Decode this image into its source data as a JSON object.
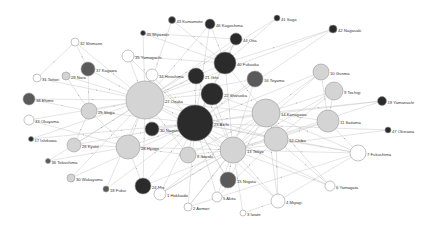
{
  "diagram": {
    "type": "network-graph",
    "colors": {
      "dark": "#2b2b2b",
      "mid": "#5a5a5a",
      "light": "#d4d4d4",
      "white": "#ffffff",
      "edge": "#c8c8c8"
    },
    "nodes": [
      {
        "id": "32",
        "label": "32 Shimane",
        "x": 75,
        "y": 42,
        "r": 4,
        "fill": "white"
      },
      {
        "id": "43",
        "label": "43 Kumamoto",
        "x": 172,
        "y": 20,
        "r": 3.5,
        "fill": "dark"
      },
      {
        "id": "46",
        "label": "46 Kagoshima",
        "x": 210,
        "y": 24,
        "r": 5,
        "fill": "dark"
      },
      {
        "id": "41",
        "label": "41 Saga",
        "x": 277,
        "y": 18,
        "r": 3,
        "fill": "dark"
      },
      {
        "id": "45",
        "label": "45 Miyazaki",
        "x": 143,
        "y": 33,
        "r": 2.5,
        "fill": "dark"
      },
      {
        "id": "42",
        "label": "42 Nagasaki",
        "x": 333,
        "y": 29,
        "r": 4,
        "fill": "dark"
      },
      {
        "id": "44",
        "label": "44 Oita",
        "x": 236,
        "y": 39,
        "r": 6,
        "fill": "dark"
      },
      {
        "id": "35",
        "label": "35 Yamaguchi",
        "x": 128,
        "y": 56,
        "r": 6,
        "fill": "white"
      },
      {
        "id": "37",
        "label": "37 Kagawa",
        "x": 88,
        "y": 69,
        "r": 7,
        "fill": "mid"
      },
      {
        "id": "31",
        "label": "31 Tottori",
        "x": 37,
        "y": 78,
        "r": 4,
        "fill": "white"
      },
      {
        "id": "29",
        "label": "29 Nara",
        "x": 66,
        "y": 76,
        "r": 4,
        "fill": "light"
      },
      {
        "id": "40",
        "label": "40 Fukuoka",
        "x": 225,
        "y": 63,
        "r": 11,
        "fill": "dark"
      },
      {
        "id": "34",
        "label": "34 Hiroshima",
        "x": 152,
        "y": 75,
        "r": 6,
        "fill": "white"
      },
      {
        "id": "21",
        "label": "21 Gifu",
        "x": 196,
        "y": 76,
        "r": 8,
        "fill": "dark"
      },
      {
        "id": "16",
        "label": "16 Toyama",
        "x": 255,
        "y": 79,
        "r": 8,
        "fill": "mid"
      },
      {
        "id": "10",
        "label": "10 Gunma",
        "x": 321,
        "y": 72,
        "r": 8,
        "fill": "light"
      },
      {
        "id": "38",
        "label": "38 Ehime",
        "x": 29,
        "y": 99,
        "r": 6,
        "fill": "mid"
      },
      {
        "id": "27",
        "label": "27 Osaka",
        "x": 145,
        "y": 100,
        "r": 19,
        "fill": "light"
      },
      {
        "id": "22",
        "label": "22 Shizuoka",
        "x": 212,
        "y": 94,
        "r": 11,
        "fill": "dark"
      },
      {
        "id": "9",
        "label": "9 Tochigi",
        "x": 334,
        "y": 91,
        "r": 9,
        "fill": "light"
      },
      {
        "id": "19",
        "label": "19 Yamanashi",
        "x": 382,
        "y": 101,
        "r": 4.5,
        "fill": "dark"
      },
      {
        "id": "25",
        "label": "25 Shiga",
        "x": 89,
        "y": 111,
        "r": 8,
        "fill": "light"
      },
      {
        "id": "14",
        "label": "14 Kanagawa",
        "x": 266,
        "y": 113,
        "r": 14,
        "fill": "light"
      },
      {
        "id": "33",
        "label": "33 Okayama",
        "x": 29,
        "y": 120,
        "r": 5,
        "fill": "white"
      },
      {
        "id": "30",
        "label": "30 Nagano",
        "x": 152,
        "y": 129,
        "r": 7,
        "fill": "dark"
      },
      {
        "id": "23",
        "label": "23 Aichi",
        "x": 195,
        "y": 123,
        "r": 18,
        "fill": "dark"
      },
      {
        "id": "11",
        "label": "11 Saitama",
        "x": 328,
        "y": 121,
        "r": 11,
        "fill": "light"
      },
      {
        "id": "17",
        "label": "17 Ishikawa",
        "x": 31,
        "y": 139,
        "r": 2.5,
        "fill": "dark"
      },
      {
        "id": "47",
        "label": "47 Okinawa",
        "x": 388,
        "y": 130,
        "r": 3,
        "fill": "dark"
      },
      {
        "id": "28",
        "label": "28 Hyogo",
        "x": 128,
        "y": 147,
        "r": 12,
        "fill": "light"
      },
      {
        "id": "26",
        "label": "26 Kyoto",
        "x": 74,
        "y": 145,
        "r": 7,
        "fill": "light"
      },
      {
        "id": "12",
        "label": "12 Chiba",
        "x": 276,
        "y": 139,
        "r": 12,
        "fill": "light"
      },
      {
        "id": "13",
        "label": "13 Tokyo",
        "x": 233,
        "y": 150,
        "r": 13,
        "fill": "light"
      },
      {
        "id": "8",
        "label": "8 Ibaraki",
        "x": 188,
        "y": 155,
        "r": 8,
        "fill": "light"
      },
      {
        "id": "36",
        "label": "36 Tokushima",
        "x": 48,
        "y": 161,
        "r": 2.5,
        "fill": "mid"
      },
      {
        "id": "15",
        "label": "15 Niigata",
        "x": 228,
        "y": 180,
        "r": 8,
        "fill": "mid"
      },
      {
        "id": "7",
        "label": "7 Fukushima",
        "x": 358,
        "y": 153,
        "r": 8,
        "fill": "white"
      },
      {
        "id": "30w",
        "label": "30 Wakayama",
        "x": 71,
        "y": 178,
        "r": 4,
        "fill": "light"
      },
      {
        "id": "24",
        "label": "24 Mie",
        "x": 143,
        "y": 186,
        "r": 8,
        "fill": "dark"
      },
      {
        "id": "18",
        "label": "18 Fukui",
        "x": 106,
        "y": 189,
        "r": 3,
        "fill": "mid"
      },
      {
        "id": "1",
        "label": "1 Hokkaido",
        "x": 160,
        "y": 194,
        "r": 6,
        "fill": "white"
      },
      {
        "id": "5",
        "label": "5 Akita",
        "x": 217,
        "y": 197,
        "r": 5,
        "fill": "white"
      },
      {
        "id": "6",
        "label": "6 Yamagata",
        "x": 330,
        "y": 186,
        "r": 5,
        "fill": "white"
      },
      {
        "id": "4",
        "label": "4 Miyagi",
        "x": 278,
        "y": 201,
        "r": 7,
        "fill": "white"
      },
      {
        "id": "2",
        "label": "2 Aomori",
        "x": 188,
        "y": 207,
        "r": 4,
        "fill": "white"
      },
      {
        "id": "3",
        "label": "3 Iwate",
        "x": 243,
        "y": 213,
        "r": 3,
        "fill": "white"
      }
    ],
    "edges": [
      [
        "32",
        "27"
      ],
      [
        "32",
        "31"
      ],
      [
        "32",
        "37"
      ],
      [
        "43",
        "40"
      ],
      [
        "43",
        "27"
      ],
      [
        "46",
        "40"
      ],
      [
        "46",
        "27"
      ],
      [
        "46",
        "23"
      ],
      [
        "45",
        "27"
      ],
      [
        "45",
        "40"
      ],
      [
        "45",
        "44"
      ],
      [
        "41",
        "40"
      ],
      [
        "41",
        "27"
      ],
      [
        "42",
        "40"
      ],
      [
        "42",
        "27"
      ],
      [
        "42",
        "23"
      ],
      [
        "44",
        "40"
      ],
      [
        "44",
        "27"
      ],
      [
        "44",
        "23"
      ],
      [
        "35",
        "27"
      ],
      [
        "35",
        "40"
      ],
      [
        "35",
        "23"
      ],
      [
        "37",
        "27"
      ],
      [
        "37",
        "25"
      ],
      [
        "31",
        "27"
      ],
      [
        "29",
        "27"
      ],
      [
        "29",
        "25"
      ],
      [
        "40",
        "27"
      ],
      [
        "40",
        "23"
      ],
      [
        "40",
        "13"
      ],
      [
        "40",
        "14"
      ],
      [
        "34",
        "27"
      ],
      [
        "34",
        "23"
      ],
      [
        "21",
        "23"
      ],
      [
        "21",
        "27"
      ],
      [
        "21",
        "13"
      ],
      [
        "16",
        "23"
      ],
      [
        "16",
        "13"
      ],
      [
        "16",
        "27"
      ],
      [
        "10",
        "13"
      ],
      [
        "10",
        "14"
      ],
      [
        "10",
        "11"
      ],
      [
        "10",
        "23"
      ],
      [
        "38",
        "27"
      ],
      [
        "38",
        "25"
      ],
      [
        "27",
        "23"
      ],
      [
        "27",
        "13"
      ],
      [
        "27",
        "28"
      ],
      [
        "27",
        "25"
      ],
      [
        "27",
        "30"
      ],
      [
        "27",
        "14"
      ],
      [
        "27",
        "12"
      ],
      [
        "22",
        "23"
      ],
      [
        "22",
        "13"
      ],
      [
        "22",
        "27"
      ],
      [
        "22",
        "14"
      ],
      [
        "9",
        "13"
      ],
      [
        "9",
        "11"
      ],
      [
        "9",
        "14"
      ],
      [
        "9",
        "12"
      ],
      [
        "19",
        "13"
      ],
      [
        "19",
        "14"
      ],
      [
        "19",
        "23"
      ],
      [
        "25",
        "23"
      ],
      [
        "25",
        "28"
      ],
      [
        "25",
        "26"
      ],
      [
        "14",
        "13"
      ],
      [
        "14",
        "23"
      ],
      [
        "14",
        "12"
      ],
      [
        "14",
        "11"
      ],
      [
        "33",
        "27"
      ],
      [
        "33",
        "28"
      ],
      [
        "30",
        "23"
      ],
      [
        "30",
        "13"
      ],
      [
        "23",
        "13"
      ],
      [
        "23",
        "28"
      ],
      [
        "23",
        "8"
      ],
      [
        "23",
        "12"
      ],
      [
        "23",
        "15"
      ],
      [
        "11",
        "13"
      ],
      [
        "11",
        "12"
      ],
      [
        "11",
        "7"
      ],
      [
        "17",
        "27"
      ],
      [
        "17",
        "23"
      ],
      [
        "47",
        "13"
      ],
      [
        "47",
        "23"
      ],
      [
        "28",
        "26"
      ],
      [
        "28",
        "24"
      ],
      [
        "28",
        "8"
      ],
      [
        "28",
        "13"
      ],
      [
        "26",
        "27"
      ],
      [
        "26",
        "23"
      ],
      [
        "12",
        "13"
      ],
      [
        "12",
        "7"
      ],
      [
        "12",
        "6"
      ],
      [
        "13",
        "8"
      ],
      [
        "13",
        "15"
      ],
      [
        "13",
        "7"
      ],
      [
        "13",
        "4"
      ],
      [
        "13",
        "5"
      ],
      [
        "13",
        "1"
      ],
      [
        "13",
        "2"
      ],
      [
        "36",
        "27"
      ],
      [
        "36",
        "28"
      ],
      [
        "15",
        "23"
      ],
      [
        "15",
        "14"
      ],
      [
        "7",
        "14"
      ],
      [
        "7",
        "23"
      ],
      [
        "7",
        "4"
      ],
      [
        "30w",
        "27"
      ],
      [
        "30w",
        "23"
      ],
      [
        "24",
        "23"
      ],
      [
        "24",
        "27"
      ],
      [
        "24",
        "13"
      ],
      [
        "18",
        "27"
      ],
      [
        "18",
        "23"
      ],
      [
        "1",
        "13"
      ],
      [
        "1",
        "23"
      ],
      [
        "1",
        "14"
      ],
      [
        "5",
        "23"
      ],
      [
        "5",
        "12"
      ],
      [
        "6",
        "13"
      ],
      [
        "6",
        "14"
      ],
      [
        "6",
        "23"
      ],
      [
        "4",
        "23"
      ],
      [
        "4",
        "14"
      ],
      [
        "4",
        "12"
      ],
      [
        "2",
        "13"
      ],
      [
        "2",
        "23"
      ],
      [
        "2",
        "7"
      ],
      [
        "3",
        "13"
      ],
      [
        "3",
        "4"
      ],
      [
        "8",
        "27"
      ],
      [
        "8",
        "14"
      ]
    ]
  }
}
